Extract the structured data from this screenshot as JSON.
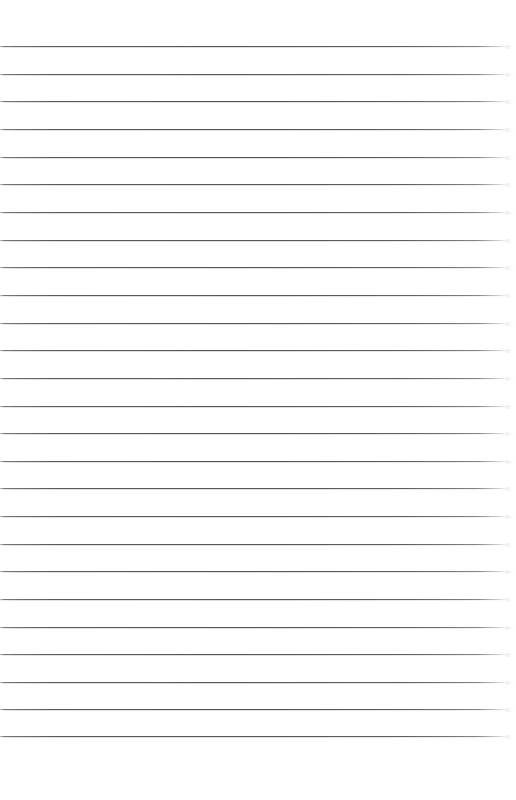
{
  "document": {
    "kind": "scanned-lined-paper",
    "title": "Blank ruled notebook page",
    "description": "A scanned blank sheet of ruled (lined) writing paper. No handwriting, no printed text, no margin rule.",
    "background_color": "#ffffff",
    "page_width": 516,
    "page_height": 800,
    "written_content": "",
    "header_text": "",
    "footer_text": "",
    "page_number": ""
  },
  "ruling": {
    "line_color": "#5a5a5e",
    "line_color_light": "#b0b0b5",
    "line_count": 26,
    "first_line_y": 46,
    "line_spacing": 27.6,
    "line_thickness": 1,
    "line_start_x": 0,
    "line_end_x": 508,
    "taper_width": 10,
    "has_vertical_margin_rule": false,
    "lines": [
      {
        "index": 1,
        "y": 46,
        "length": 508
      },
      {
        "index": 2,
        "y": 74,
        "length": 508
      },
      {
        "index": 3,
        "y": 101,
        "length": 508
      },
      {
        "index": 4,
        "y": 129,
        "length": 508
      },
      {
        "index": 5,
        "y": 157,
        "length": 508
      },
      {
        "index": 6,
        "y": 184,
        "length": 508
      },
      {
        "index": 7,
        "y": 212,
        "length": 508
      },
      {
        "index": 8,
        "y": 240,
        "length": 508
      },
      {
        "index": 9,
        "y": 267,
        "length": 508
      },
      {
        "index": 10,
        "y": 295,
        "length": 508
      },
      {
        "index": 11,
        "y": 323,
        "length": 508
      },
      {
        "index": 12,
        "y": 350,
        "length": 508
      },
      {
        "index": 13,
        "y": 378,
        "length": 508
      },
      {
        "index": 14,
        "y": 406,
        "length": 508
      },
      {
        "index": 15,
        "y": 433,
        "length": 508
      },
      {
        "index": 16,
        "y": 461,
        "length": 508
      },
      {
        "index": 17,
        "y": 488,
        "length": 508
      },
      {
        "index": 18,
        "y": 516,
        "length": 508
      },
      {
        "index": 19,
        "y": 544,
        "length": 508
      },
      {
        "index": 20,
        "y": 571,
        "length": 508
      },
      {
        "index": 21,
        "y": 599,
        "length": 508
      },
      {
        "index": 22,
        "y": 627,
        "length": 508
      },
      {
        "index": 23,
        "y": 654,
        "length": 508
      },
      {
        "index": 24,
        "y": 682,
        "length": 508
      },
      {
        "index": 25,
        "y": 709,
        "length": 508
      },
      {
        "index": 26,
        "y": 736,
        "length": 508
      }
    ]
  }
}
